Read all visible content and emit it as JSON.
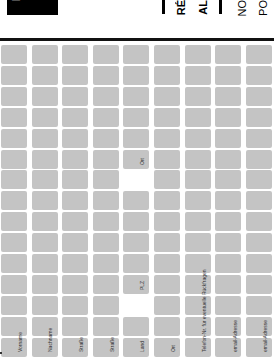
{
  "header": {
    "logo_text": "L",
    "title_lines": [
      "RÉ",
      "AL"
    ],
    "subtitle_lines": [
      "NO",
      "PO"
    ]
  },
  "form": {
    "orientation": "rotated-90-ccw",
    "columns": 9,
    "rows": 15,
    "cell_color": "#c4c4c4",
    "labels": [
      {
        "text": "Vorname",
        "column": 0
      },
      {
        "text": "Nachname",
        "column": 1
      },
      {
        "text": "Straße",
        "column": 2
      },
      {
        "text": "Straße",
        "column": 3
      },
      {
        "text": "Land",
        "column": 4
      },
      {
        "text": "Ort",
        "column": 5
      },
      {
        "text": "Telefon-Nr. für eventuelle Rückfragen",
        "column": 6
      },
      {
        "text": "email-Adresse",
        "column": 7
      },
      {
        "text": "email-Adresse",
        "column": 8
      },
      {
        "text": "PLZ",
        "column": 4
      },
      {
        "text": "Ort",
        "column": 4
      }
    ]
  }
}
